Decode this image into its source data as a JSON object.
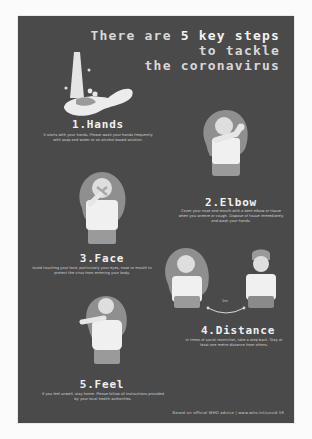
{
  "title": {
    "line1_prefix": "There are ",
    "line1_highlight": "5 key steps",
    "line2": "to tackle",
    "line3": "the coronavirus"
  },
  "steps": [
    {
      "number": "1",
      "title": "1.Hands",
      "description": "It starts with your hands. Please wash your hands frequently with soap and water or an alcohol-based solution.",
      "illustration": "hand-washing-icon"
    },
    {
      "number": "2",
      "title": "2.Elbow",
      "description": "Cover your nose and mouth with a bent elbow or tissue when you sneeze or cough. Dispose of tissue immediately and wash your hands.",
      "illustration": "person-sneezing-into-elbow-icon"
    },
    {
      "number": "3",
      "title": "3.Face",
      "description": "Avoid touching your face, particularly your eyes, nose or mouth to protect the virus from entering your body.",
      "illustration": "person-covering-face-icon"
    },
    {
      "number": "4",
      "title": "4.Distance",
      "description": "In times of social restriction, take a step back. Stay at least one metre distance from others.",
      "illustration": "two-people-distance-icon",
      "distance_label": "1m"
    },
    {
      "number": "5",
      "title": "5.Feel",
      "description": "If you feel unwell, stay home. Please follow all instructions provided by your local health authorities.",
      "illustration": "person-feeling-unwell-icon"
    }
  ],
  "footer": "Based on official WHO advice | www.who.int/covid-19",
  "colors": {
    "background": "#4a4a4a",
    "text": "#e6e6e6",
    "figure_light": "#f0f0f0",
    "figure_mid": "#9a9a9a",
    "page": "#fbfbfb"
  }
}
